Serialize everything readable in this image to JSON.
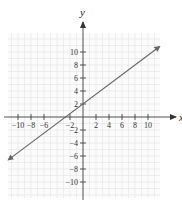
{
  "chart_data": {
    "type": "line",
    "title": "",
    "xlabel": "x",
    "ylabel": "y",
    "xlim": [
      -11.8,
      11.8
    ],
    "ylim": [
      -12.4,
      12.4
    ],
    "grid": true,
    "x_ticks": [
      -10,
      -8,
      -6,
      -2,
      2,
      4,
      6,
      8,
      10
    ],
    "y_ticks": [
      10,
      8,
      6,
      4,
      2,
      -2,
      -4,
      -6,
      -8,
      -10
    ],
    "x_tick_labels": [
      "−10",
      "−8",
      "−6",
      "−2",
      "2",
      "4",
      "6",
      "8",
      "10"
    ],
    "y_tick_labels": [
      "10",
      "8",
      "6",
      "4",
      "2",
      "−2",
      "−4",
      "−6",
      "−8",
      "−10"
    ],
    "series": [
      {
        "name": "line",
        "equation": "y = 0.75x + 2",
        "slope": 0.75,
        "intercept": 2,
        "x": [
          -11.5,
          11.8
        ],
        "y": [
          -6.6,
          10.85
        ],
        "arrows_both_ends": true,
        "color": "#666666"
      }
    ]
  },
  "colors": {
    "grid": "#e4e4e4",
    "axis": "#444444",
    "line": "#666666"
  }
}
